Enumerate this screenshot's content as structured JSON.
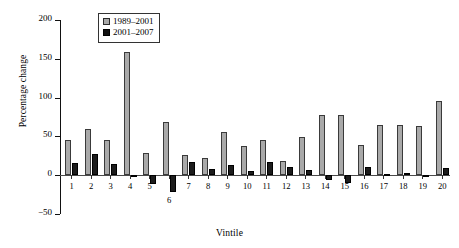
{
  "chart_data": {
    "type": "bar",
    "title": "",
    "xlabel": "Vintile",
    "ylabel": "Percentage change",
    "ylim": [
      -50,
      200
    ],
    "yticks": [
      200,
      150,
      100,
      50,
      0,
      -50
    ],
    "ytick_labels": [
      "200",
      "150",
      "100",
      "50",
      "0",
      "−50"
    ],
    "grid": false,
    "legend_position": "top-center",
    "categories": [
      "1",
      "2",
      "3",
      "4",
      "5",
      "6",
      "7",
      "8",
      "9",
      "10",
      "11",
      "12",
      "13",
      "14",
      "15",
      "16",
      "17",
      "18",
      "19",
      "20"
    ],
    "series": [
      {
        "name": "1989–2001",
        "color": "#a9a9a9",
        "values": [
          46,
          60,
          45,
          159,
          29,
          68,
          26,
          22,
          56,
          38,
          46,
          18,
          49,
          77,
          78,
          39,
          65,
          65,
          63,
          96
        ]
      },
      {
        "name": "2001–2007",
        "color": "#1c1c1c",
        "values": [
          16,
          27,
          14,
          -1,
          -12,
          -22,
          17,
          8,
          13,
          5,
          17,
          11,
          7,
          -6,
          -10,
          10,
          2,
          3,
          -1,
          9
        ]
      }
    ]
  },
  "legend": {
    "items": [
      {
        "label": "1989–2001",
        "swatch": "legend-swatch-gray"
      },
      {
        "label": "2001–2007",
        "swatch": "legend-swatch-black"
      }
    ]
  },
  "axes": {
    "y_title": "Percentage change",
    "x_title": "Vintile"
  }
}
